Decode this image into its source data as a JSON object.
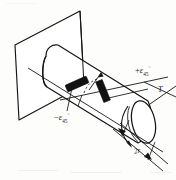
{
  "figure": {
    "background_color": "#fdfdfb",
    "ink_color": "#151515",
    "labels": {
      "strain_positive": {
        "sign": "+",
        "symbol": "ε",
        "subscript": "45",
        "degree": "°",
        "full_text": "+ε45°"
      },
      "strain_negative": {
        "sign": "−",
        "symbol": "ε",
        "subscript": "45",
        "degree": "°",
        "full_text": "−ε45°"
      },
      "torque": {
        "symbol": "T",
        "full_text": "T"
      },
      "diameter": {
        "symbol": "2r",
        "full_text": "2r"
      }
    },
    "elements": {
      "wall_plate": "fixed-support-plate",
      "shaft": "circular-cylindrical-shaft",
      "gauge_a": "strain-gauge-minus-45",
      "gauge_b": "strain-gauge-plus-45",
      "angle_arc": "dashed-angle-arc-between-gauges",
      "torque_arrow": "curved-torque-arrow",
      "dimension_line": "diameter-dimension-line"
    }
  }
}
